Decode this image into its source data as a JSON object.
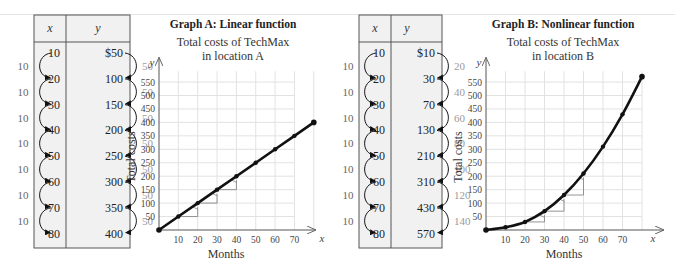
{
  "tables": [
    {
      "id": "A",
      "header": {
        "x": "x",
        "y": "y"
      },
      "rows": [
        {
          "x": "10",
          "y": "$50"
        },
        {
          "x": "20",
          "y": "100"
        },
        {
          "x": "30",
          "y": "150"
        },
        {
          "x": "40",
          "y": "200"
        },
        {
          "x": "50",
          "y": "250"
        },
        {
          "x": "60",
          "y": "300"
        },
        {
          "x": "70",
          "y": "350"
        },
        {
          "x": "80",
          "y": "400"
        }
      ],
      "x_differences": [
        "10",
        "10",
        "10",
        "10",
        "10",
        "10",
        "10"
      ],
      "y_differences": [
        "50",
        "50",
        "50",
        "50",
        "50",
        "50",
        "50"
      ]
    },
    {
      "id": "B",
      "header": {
        "x": "x",
        "y": "y"
      },
      "rows": [
        {
          "x": "10",
          "y": "$10"
        },
        {
          "x": "20",
          "y": "30"
        },
        {
          "x": "30",
          "y": "70"
        },
        {
          "x": "40",
          "y": "130"
        },
        {
          "x": "50",
          "y": "210"
        },
        {
          "x": "60",
          "y": "310"
        },
        {
          "x": "70",
          "y": "430"
        },
        {
          "x": "80",
          "y": "570"
        }
      ],
      "x_differences": [
        "10",
        "10",
        "10",
        "10",
        "10",
        "10",
        "10"
      ],
      "y_differences": [
        "20",
        "40",
        "60",
        "80",
        "100",
        "120",
        "140"
      ]
    }
  ],
  "graphs": [
    {
      "id": "A",
      "title": "Graph A:  Linear function",
      "subtitle_line1": "Total costs of TechMax",
      "subtitle_line2": "in location A",
      "xlabel": "Months",
      "ylabel": "Total costs",
      "x_var": "x",
      "y_var": "y"
    },
    {
      "id": "B",
      "title": "Graph B:  Nonlinear function",
      "subtitle_line1": "Total costs of TechMax",
      "subtitle_line2": "in location B",
      "xlabel": "Months",
      "ylabel": "Total costs",
      "x_var": "x",
      "y_var": "y"
    }
  ],
  "colors": {
    "line": "#111111",
    "grid": "#e2e2e2",
    "table_fill": "#f1f1f1",
    "table_border": "#555555",
    "step_marker": "#888888"
  },
  "chart_data": [
    {
      "type": "line",
      "title": "Graph A: Linear function — Total costs of TechMax in location A",
      "xlabel": "Months",
      "ylabel": "Total costs",
      "x": [
        0,
        10,
        20,
        30,
        40,
        50,
        60,
        70,
        80
      ],
      "series": [
        {
          "name": "Location A",
          "values": [
            0,
            50,
            100,
            150,
            200,
            250,
            300,
            350,
            400
          ]
        }
      ],
      "x_ticks": [
        10,
        20,
        30,
        40,
        50,
        60,
        70
      ],
      "y_ticks": [
        50,
        100,
        150,
        200,
        250,
        300,
        350,
        400,
        450,
        500,
        550
      ],
      "xlim": [
        0,
        80
      ],
      "ylim": [
        0,
        600
      ],
      "grid": true,
      "annotations": "rise/run step markers between x=10→20, 20→30, 30→40 (rise 50 per run 10)"
    },
    {
      "type": "line",
      "title": "Graph B: Nonlinear function — Total costs of TechMax in location B",
      "xlabel": "Months",
      "ylabel": "Total costs",
      "x": [
        0,
        10,
        20,
        30,
        40,
        50,
        60,
        70,
        80
      ],
      "series": [
        {
          "name": "Location B",
          "values": [
            0,
            10,
            30,
            70,
            130,
            210,
            310,
            430,
            570
          ]
        }
      ],
      "x_ticks": [
        10,
        20,
        30,
        40,
        50,
        60,
        70
      ],
      "y_ticks": [
        50,
        100,
        150,
        200,
        250,
        300,
        350,
        400,
        450,
        500,
        550
      ],
      "xlim": [
        0,
        80
      ],
      "ylim": [
        0,
        600
      ],
      "grid": true,
      "annotations": "rise/run step markers between x=20→30, 30→40, 40→50 (rises 40, 60, 80 per run 10)"
    }
  ]
}
